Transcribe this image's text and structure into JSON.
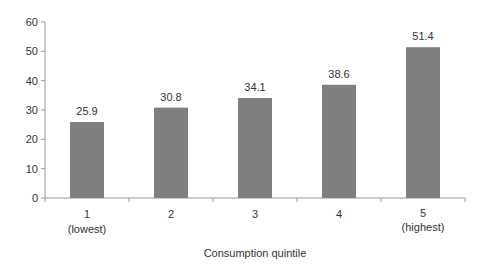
{
  "chart_data": {
    "type": "bar",
    "title": "",
    "xlabel": "Consumption quintile",
    "ylabel": "",
    "categories": [
      "1\n(lowest)",
      "2",
      "3",
      "4",
      "5\n(highest)"
    ],
    "category_lines": [
      [
        "1",
        "(lowest)"
      ],
      [
        "2"
      ],
      [
        "3"
      ],
      [
        "4"
      ],
      [
        "5",
        "(highest)"
      ]
    ],
    "values": [
      25.9,
      30.8,
      34.1,
      38.6,
      51.4
    ],
    "data_labels": [
      "25.9",
      "30.8",
      "34.1",
      "38.6",
      "51.4"
    ],
    "ylim": [
      0,
      60
    ],
    "yticks": [
      0,
      10,
      20,
      30,
      40,
      50,
      60
    ],
    "grid": false,
    "legend": null,
    "bar_color": "#7f7f7f"
  }
}
